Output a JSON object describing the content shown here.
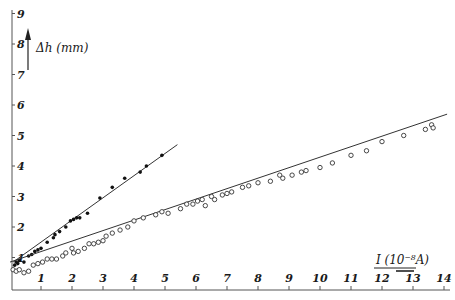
{
  "chart_data": {
    "type": "scatter",
    "title": "",
    "xlabel": "I (10^-8 A)",
    "ylabel": "Δh (mm)",
    "xlim": [
      0,
      14.2
    ],
    "ylim": [
      0,
      9
    ],
    "grid": false,
    "legend": null,
    "x_ticks": [
      "1",
      "2",
      "3",
      "4",
      "5",
      "6",
      "7",
      "8",
      "9",
      "10",
      "11",
      "12",
      "13",
      "14"
    ],
    "y_ticks": [
      "1",
      "2",
      "3",
      "4",
      "5",
      "6",
      "7",
      "8",
      "9"
    ],
    "series": [
      {
        "name": "filled-dots",
        "marker": "filled-circle",
        "fit_line": {
          "from": [
            0.1,
            0.85
          ],
          "to": [
            5.4,
            4.7
          ]
        },
        "points": [
          [
            0.15,
            0.75
          ],
          [
            0.2,
            0.85
          ],
          [
            0.25,
            0.8
          ],
          [
            0.3,
            0.9
          ],
          [
            0.45,
            0.85
          ],
          [
            0.6,
            1.05
          ],
          [
            0.7,
            1.1
          ],
          [
            0.8,
            1.2
          ],
          [
            0.9,
            1.25
          ],
          [
            1.0,
            1.3
          ],
          [
            1.2,
            1.5
          ],
          [
            1.4,
            1.65
          ],
          [
            1.45,
            1.75
          ],
          [
            1.6,
            1.85
          ],
          [
            1.8,
            2.0
          ],
          [
            1.95,
            2.2
          ],
          [
            2.05,
            2.25
          ],
          [
            2.15,
            2.3
          ],
          [
            2.25,
            2.3
          ],
          [
            2.5,
            2.45
          ],
          [
            2.9,
            2.95
          ],
          [
            3.3,
            3.3
          ],
          [
            3.7,
            3.6
          ],
          [
            4.2,
            3.8
          ],
          [
            4.4,
            4.0
          ],
          [
            4.9,
            4.35
          ]
        ]
      },
      {
        "name": "open-circles",
        "marker": "open-circle",
        "fit_line": {
          "from": [
            0.0,
            0.85
          ],
          "to": [
            14.1,
            5.7
          ]
        },
        "points": [
          [
            0.1,
            0.6
          ],
          [
            0.2,
            0.55
          ],
          [
            0.3,
            0.6
          ],
          [
            0.45,
            0.5
          ],
          [
            0.6,
            0.55
          ],
          [
            0.75,
            0.75
          ],
          [
            0.9,
            0.8
          ],
          [
            1.05,
            0.85
          ],
          [
            1.2,
            0.95
          ],
          [
            1.35,
            0.95
          ],
          [
            1.5,
            0.95
          ],
          [
            1.7,
            1.05
          ],
          [
            1.8,
            1.15
          ],
          [
            2.0,
            1.3
          ],
          [
            2.05,
            1.15
          ],
          [
            2.2,
            1.2
          ],
          [
            2.4,
            1.3
          ],
          [
            2.55,
            1.45
          ],
          [
            2.7,
            1.45
          ],
          [
            2.85,
            1.5
          ],
          [
            3.0,
            1.55
          ],
          [
            3.1,
            1.7
          ],
          [
            3.3,
            1.8
          ],
          [
            3.55,
            1.9
          ],
          [
            3.8,
            2.0
          ],
          [
            4.0,
            2.2
          ],
          [
            4.3,
            2.3
          ],
          [
            4.7,
            2.4
          ],
          [
            4.9,
            2.5
          ],
          [
            5.1,
            2.45
          ],
          [
            5.5,
            2.6
          ],
          [
            5.7,
            2.75
          ],
          [
            5.9,
            2.75
          ],
          [
            6.05,
            2.85
          ],
          [
            6.2,
            2.9
          ],
          [
            6.3,
            2.7
          ],
          [
            6.5,
            3.0
          ],
          [
            6.6,
            2.9
          ],
          [
            6.85,
            3.05
          ],
          [
            7.0,
            3.1
          ],
          [
            7.15,
            3.15
          ],
          [
            7.5,
            3.3
          ],
          [
            7.7,
            3.35
          ],
          [
            8.0,
            3.45
          ],
          [
            8.4,
            3.5
          ],
          [
            8.7,
            3.7
          ],
          [
            8.8,
            3.6
          ],
          [
            9.1,
            3.7
          ],
          [
            9.4,
            3.8
          ],
          [
            9.55,
            3.85
          ],
          [
            10.0,
            3.95
          ],
          [
            10.4,
            4.1
          ],
          [
            11.0,
            4.35
          ],
          [
            11.5,
            4.5
          ],
          [
            12.0,
            4.8
          ],
          [
            12.7,
            5.0
          ],
          [
            13.4,
            5.2
          ],
          [
            13.6,
            5.35
          ],
          [
            13.65,
            5.25
          ]
        ]
      }
    ]
  },
  "labels": {
    "y_axis": "Δh (mm)",
    "x_axis": "I (10⁻⁸A)"
  }
}
